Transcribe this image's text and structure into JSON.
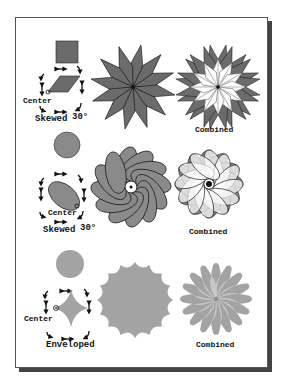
{
  "figure": {
    "colors": {
      "fill_dark": "#6b6b6b",
      "fill_mid": "#8a8a8a",
      "fill_light": "#a3a3a3",
      "stroke": "#111111",
      "white": "#ffffff",
      "frame_shadow": "#444444"
    },
    "rows": [
      {
        "name": "square",
        "source_shape": "square",
        "transform_labels": {
          "center": "Center",
          "skew": "Skewed",
          "angle": "30°"
        },
        "rotated_shape": "12-point star of skewed parallelograms",
        "combined_label": "Combined"
      },
      {
        "name": "circle",
        "source_shape": "circle",
        "transform_labels": {
          "center": "Center",
          "skew": "Skewed",
          "angle": "30°"
        },
        "rotated_shape": "spiral of 12 ellipses",
        "combined_label": "Combined"
      },
      {
        "name": "enveloped-circle",
        "source_shape": "circle",
        "transform_labels": {
          "center": "Center",
          "skew": "Enveloped"
        },
        "rotated_shape": "16-point wavy star",
        "combined_label": "Combined"
      }
    ]
  }
}
